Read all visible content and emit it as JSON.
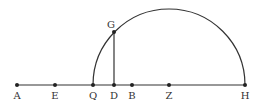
{
  "diagram": {
    "type": "geometry",
    "colors": {
      "stroke": "#333333",
      "background": "#ffffff"
    },
    "baseline": {
      "from": "A",
      "to": "H",
      "y": 85
    },
    "semicircle": {
      "center": "Z",
      "radius": 76,
      "from": "Q",
      "to": "H"
    },
    "perpendicular": {
      "from": "D",
      "to": "G"
    },
    "points": [
      {
        "label": "A",
        "x": 17,
        "y": 85
      },
      {
        "label": "E",
        "x": 55,
        "y": 85
      },
      {
        "label": "Q",
        "x": 93,
        "y": 85
      },
      {
        "label": "D",
        "x": 114,
        "y": 85
      },
      {
        "label": "B",
        "x": 132,
        "y": 85
      },
      {
        "label": "Z",
        "x": 169,
        "y": 85
      },
      {
        "label": "H",
        "x": 245,
        "y": 85
      },
      {
        "label": "G",
        "x": 114,
        "y": 32
      }
    ]
  }
}
